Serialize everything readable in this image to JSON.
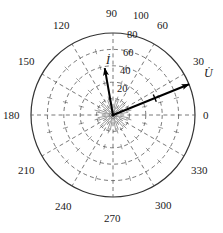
{
  "figure": {
    "kind": "polar-phasor-diagram",
    "background": "#ffffff",
    "line_color": "#333333",
    "grid_color": "#555555",
    "vector_color": "#000000"
  },
  "chart_data": {
    "type": "scatter",
    "title": "",
    "subtitle": "",
    "xlabel": "",
    "ylabel": "",
    "projection": "polar",
    "grid": true,
    "legend_position": "none",
    "angle_unit": "degrees",
    "angle_direction": "counterclockwise",
    "angle_zero_location": "E",
    "angular_tick_step": 30,
    "angular_ticks": [
      0,
      30,
      60,
      90,
      120,
      150,
      180,
      210,
      240,
      270,
      300,
      330
    ],
    "angular_tick_labels": [
      "0",
      "30",
      "60",
      "90",
      "120",
      "150",
      "180",
      "210",
      "240",
      "270",
      "300",
      "330"
    ],
    "radial_ticks": [
      20,
      40,
      60,
      80,
      100
    ],
    "radial_tick_labels": [
      "20",
      "40",
      "60",
      "80",
      "100"
    ],
    "rlim": [
      0,
      100
    ],
    "radial_label_angle": 84,
    "minor_radial_rings": true,
    "series": [
      {
        "name": "I",
        "label": "İ",
        "kind": "phasor",
        "magnitude": 58,
        "angle": 100,
        "has_arrow": true,
        "has_crosstick": false
      },
      {
        "name": "U",
        "label": "U̇",
        "kind": "phasor",
        "magnitude": 100,
        "angle": 22,
        "has_arrow": true,
        "has_crosstick": true
      }
    ],
    "annotations": [
      {
        "text": "İ",
        "role": "current-phasor-label",
        "angle": 100,
        "r": 66
      },
      {
        "text": "U̇",
        "role": "voltage-phasor-label",
        "angle": 22,
        "r": 112
      }
    ]
  },
  "angle_labels": [
    {
      "id": "a0",
      "text": "0",
      "x": 203,
      "y": 110
    },
    {
      "id": "a30",
      "text": "30",
      "x": 193,
      "y": 56
    },
    {
      "id": "a60",
      "text": "60",
      "x": 157,
      "y": 20
    },
    {
      "id": "a90",
      "text": "90",
      "x": 106,
      "y": 8
    },
    {
      "id": "a120",
      "text": "120",
      "x": 53,
      "y": 20
    },
    {
      "id": "a150",
      "text": "150",
      "x": 18,
      "y": 56
    },
    {
      "id": "a180",
      "text": "180",
      "x": 3,
      "y": 110
    },
    {
      "id": "a210",
      "text": "210",
      "x": 18,
      "y": 165
    },
    {
      "id": "a240",
      "text": "240",
      "x": 55,
      "y": 201
    },
    {
      "id": "a270",
      "text": "270",
      "x": 104,
      "y": 213
    },
    {
      "id": "a300",
      "text": "300",
      "x": 155,
      "y": 200
    },
    {
      "id": "a330",
      "text": "330",
      "x": 191,
      "y": 165
    }
  ],
  "radial_labels": [
    {
      "id": "r100",
      "text": "100",
      "x": 133,
      "y": 10
    },
    {
      "id": "r80",
      "text": "80",
      "x": 127,
      "y": 29
    },
    {
      "id": "r60",
      "text": "60",
      "x": 123,
      "y": 47
    },
    {
      "id": "r40",
      "text": "40",
      "x": 120,
      "y": 65
    },
    {
      "id": "r20",
      "text": "20",
      "x": 117,
      "y": 83
    }
  ],
  "vector_labels": [
    {
      "id": "vI",
      "text": "İ",
      "x": 106,
      "y": 55
    },
    {
      "id": "vU",
      "text": "U̇",
      "x": 204,
      "y": 68
    }
  ]
}
